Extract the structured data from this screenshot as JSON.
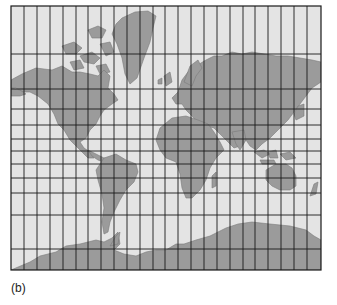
{
  "figure": {
    "caption": "(b)",
    "projection": "Mercator",
    "colors": {
      "ocean": "#e4e4e4",
      "land": "#9b9b9b",
      "coast": "#7a7a7a",
      "grid": "#1a1a1a"
    },
    "frame": {
      "x": 11,
      "y": 6,
      "width": 310,
      "height": 264
    },
    "grid": {
      "meridians_x": [
        11,
        24,
        37,
        50,
        63,
        76,
        88,
        101,
        114,
        127,
        140,
        153,
        165,
        178,
        191,
        204,
        217,
        230,
        243,
        255,
        268,
        281,
        294,
        307,
        321
      ],
      "parallels_y": [
        6,
        54,
        89,
        109,
        125,
        139,
        151,
        164,
        178,
        193,
        215,
        249,
        270
      ]
    },
    "landmasses": [
      "north-america",
      "greenland",
      "canadian-arctic-archipelago",
      "south-america",
      "europe",
      "africa",
      "asia",
      "australia",
      "antarctica",
      "japan",
      "indonesia",
      "new-zealand",
      "madagascar",
      "british-isles"
    ]
  }
}
